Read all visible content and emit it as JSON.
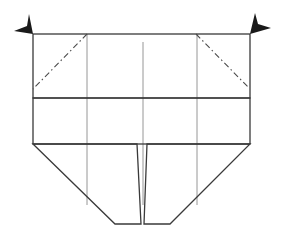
{
  "diagram": {
    "type": "origami-fold-diagram",
    "colors": {
      "outline": "#3a3a3a",
      "fold_line": "#8a8a8a",
      "mountain_fold": "#4a4a4a",
      "arrow": "#1a1a1a",
      "background": "#ffffff"
    },
    "upper_flap": {
      "x1": 33,
      "y1": 34,
      "x2": 250,
      "y2": 98
    },
    "middle_band": {
      "x1": 33,
      "y1": 98,
      "x2": 250,
      "y2": 144
    },
    "bottom_section": {
      "left_top": [
        33,
        144
      ],
      "left_bottom": [
        115,
        224
      ],
      "right_bottom": [
        170,
        224
      ],
      "right_top": [
        250,
        144
      ]
    },
    "center_slit": {
      "left_edge": [
        [
          137,
          144
        ],
        [
          141,
          224
        ]
      ],
      "right_edge": [
        [
          147,
          144
        ],
        [
          144,
          224
        ]
      ]
    },
    "vertical_fold_lines": [
      {
        "x": 87,
        "y_start": 34,
        "y_end": 205
      },
      {
        "x": 143,
        "y_start": 42,
        "y_end": 205
      },
      {
        "x": 197,
        "y_start": 34,
        "y_end": 205
      }
    ],
    "mountain_folds": [
      {
        "name": "left-corner-fold",
        "from": [
          87,
          34
        ],
        "to": [
          33,
          89
        ]
      },
      {
        "name": "right-corner-fold",
        "from": [
          196,
          34
        ],
        "to": [
          248,
          87
        ]
      }
    ],
    "arrows": [
      {
        "name": "left-corner-arrow",
        "direction": "left-up",
        "anchor": [
          33,
          34
        ]
      },
      {
        "name": "right-corner-arrow",
        "direction": "right-up",
        "anchor": [
          250,
          34
        ]
      }
    ]
  }
}
